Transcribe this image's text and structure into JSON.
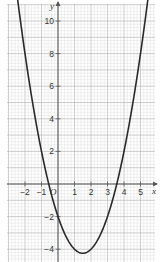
{
  "chart_data": {
    "type": "line",
    "title": "",
    "function": "y = x^2 - 3x - 2",
    "xlabel": "x",
    "ylabel": "y",
    "origin_label": "O",
    "xlim": [
      -3.1,
      5.9
    ],
    "ylim": [
      -4.7,
      11.0
    ],
    "grid": true,
    "x_ticks": [
      -2,
      -1,
      1,
      2,
      3,
      4,
      5
    ],
    "x_tick_labels": [
      "−2",
      "−1",
      "1",
      "2",
      "3",
      "4",
      "5"
    ],
    "y_ticks": [
      -4,
      -2,
      2,
      4,
      6,
      8,
      10
    ],
    "y_tick_labels": [
      "−4",
      "−2",
      "2",
      "4",
      "6",
      "8",
      "10"
    ],
    "series": [
      {
        "name": "parabola",
        "x": [
          -2.4,
          -2,
          -1.5,
          -1,
          -0.5,
          0,
          0.5,
          1,
          1.5,
          2,
          2.5,
          3,
          3.5,
          4,
          4.5,
          5,
          5.4
        ],
        "y": [
          10.96,
          8,
          4.75,
          2,
          -0.25,
          -2,
          -3.25,
          -4,
          -4.25,
          -4,
          -3.25,
          -2,
          -0.25,
          2,
          4.75,
          8,
          10.96
        ]
      }
    ],
    "key_points": {
      "vertex": [
        1.5,
        -4.25
      ],
      "roots": [
        -0.56,
        3.56
      ],
      "y_intercept": -2
    },
    "colors": {
      "grid_minor": "#d9d9d9",
      "grid_major": "#b8b8b8",
      "axes": "#555555",
      "curve": "#2a2a2a"
    }
  }
}
